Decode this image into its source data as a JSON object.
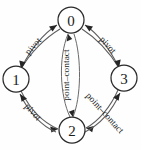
{
  "diagram": {
    "type": "state-transition-graph",
    "background_color": "#fefefe",
    "node_stroke_color": "#2b2b2b",
    "edge_color": "#5d5d5d",
    "label_color": "#232323",
    "nodes": [
      {
        "id": "0",
        "label": "0",
        "position": "top",
        "cx": 71,
        "cy": 20,
        "r": 13
      },
      {
        "id": "1",
        "label": "1",
        "position": "left",
        "cx": 16,
        "cy": 79,
        "r": 13
      },
      {
        "id": "3",
        "label": "3",
        "position": "right",
        "cx": 124,
        "cy": 78,
        "r": 13
      },
      {
        "id": "2",
        "label": "2",
        "position": "bottom",
        "cx": 72,
        "cy": 130,
        "r": 13
      }
    ],
    "edges": [
      {
        "id": "e-1-to-0",
        "from": "1",
        "to": "0",
        "label": "pivot",
        "region": "upper-left"
      },
      {
        "id": "e-0-to-1",
        "from": "0",
        "to": "1",
        "label": "pivot",
        "region": "upper-left"
      },
      {
        "id": "e-3-to-0",
        "from": "3",
        "to": "0",
        "label": "pivot",
        "region": "upper-right"
      },
      {
        "id": "e-0-to-3",
        "from": "0",
        "to": "3",
        "label": "pivot",
        "region": "upper-right"
      },
      {
        "id": "e-1-to-2",
        "from": "1",
        "to": "2",
        "label": "pivot",
        "region": "lower-left"
      },
      {
        "id": "e-2-to-1",
        "from": "2",
        "to": "1",
        "label": "pivot",
        "region": "lower-left"
      },
      {
        "id": "e-3-to-2",
        "from": "3",
        "to": "2",
        "label": "point–contact",
        "region": "lower-right"
      },
      {
        "id": "e-2-to-3",
        "from": "2",
        "to": "3",
        "label": "point–contact",
        "region": "lower-right"
      },
      {
        "id": "e-2-to-0",
        "from": "2",
        "to": "0",
        "label": "point–contact",
        "region": "center"
      },
      {
        "id": "e-0-to-2",
        "from": "0",
        "to": "2",
        "label": "point–contact",
        "region": "center"
      }
    ],
    "edge_labels": [
      {
        "id": "label-upper-left",
        "text": "pivot",
        "x": 33,
        "y": 46,
        "rotation": -48
      },
      {
        "id": "label-upper-right",
        "text": "pivot",
        "x": 108,
        "y": 45,
        "rotation": 48
      },
      {
        "id": "label-lower-left",
        "text": "pivot",
        "x": 33,
        "y": 112,
        "rotation": 48
      },
      {
        "id": "label-lower-right",
        "text": "point–contact",
        "x": 105,
        "y": 113,
        "rotation": 48
      },
      {
        "id": "label-center",
        "text": "point–contact",
        "x": 66,
        "y": 75,
        "rotation": -90
      }
    ]
  }
}
